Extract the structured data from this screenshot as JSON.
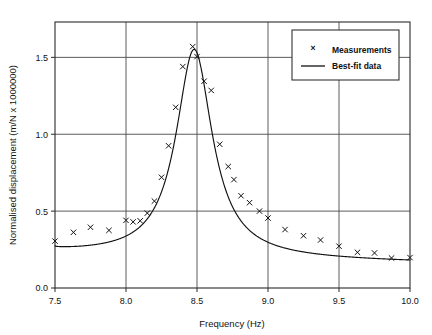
{
  "chart_data": {
    "type": "scatter",
    "title": "",
    "subtitle": "",
    "xlabel": "Frequency (Hz)",
    "ylabel": "Normalised displacement (m/N x 1000000)",
    "xlim": [
      7.5,
      10.0
    ],
    "ylim": [
      0.0,
      1.73
    ],
    "xticks": [
      7.5,
      8.0,
      8.5,
      9.0,
      9.5,
      10.0
    ],
    "xtick_labels": [
      "7.5",
      "8.0",
      "8.5",
      "9.0",
      "9.5",
      "10.0"
    ],
    "yticks": [
      0.0,
      0.5,
      1.0,
      1.5
    ],
    "ytick_labels": [
      "0.0",
      "0.5",
      "1.0",
      "1.5"
    ],
    "grid": "major-xy",
    "legend_position": "top-right",
    "series": [
      {
        "name": "Measurements",
        "marker": "x",
        "style": "points",
        "points": [
          [
            7.5,
            0.305
          ],
          [
            7.63,
            0.362
          ],
          [
            7.75,
            0.395
          ],
          [
            7.88,
            0.375
          ],
          [
            8.0,
            0.44
          ],
          [
            8.05,
            0.43
          ],
          [
            8.1,
            0.437
          ],
          [
            8.15,
            0.487
          ],
          [
            8.2,
            0.565
          ],
          [
            8.25,
            0.72
          ],
          [
            8.3,
            0.925
          ],
          [
            8.35,
            1.175
          ],
          [
            8.4,
            1.44
          ],
          [
            8.47,
            1.57
          ],
          [
            8.5,
            1.505
          ],
          [
            8.55,
            1.345
          ],
          [
            8.6,
            1.285
          ],
          [
            8.66,
            0.935
          ],
          [
            8.72,
            0.79
          ],
          [
            8.76,
            0.705
          ],
          [
            8.81,
            0.6
          ],
          [
            8.87,
            0.555
          ],
          [
            8.94,
            0.5
          ],
          [
            9.0,
            0.455
          ],
          [
            9.12,
            0.38
          ],
          [
            9.25,
            0.34
          ],
          [
            9.37,
            0.312
          ],
          [
            9.5,
            0.272
          ],
          [
            9.63,
            0.232
          ],
          [
            9.75,
            0.228
          ],
          [
            9.87,
            0.195
          ],
          [
            10.0,
            0.198
          ]
        ]
      },
      {
        "name": "Best-fit data",
        "marker": "none",
        "style": "line",
        "model": "lorentzian-resonance",
        "peak_frequency": 8.48,
        "peak_value": 1.552,
        "baseline_left": 0.242,
        "baseline_right": 0.168,
        "half_width": 0.155
      }
    ],
    "legend_entries": [
      {
        "label": "Measurements",
        "symbol": "x-marker"
      },
      {
        "label": "Best-fit data",
        "symbol": "solid-line"
      }
    ]
  },
  "colors": {
    "background": "#ffffff",
    "axis": "#2a2a2a",
    "grid": "#4a4a4a",
    "curve": "#111111",
    "marker": "#111111",
    "text": "#111111"
  }
}
